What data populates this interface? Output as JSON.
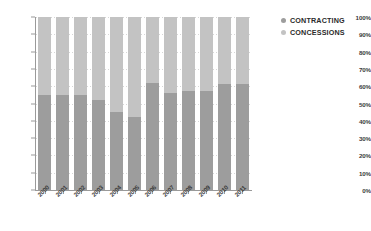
{
  "chart_data": {
    "type": "bar",
    "subtype": "100-percent-stacked-column",
    "title": "",
    "xlabel": "",
    "ylabel": "",
    "ylim": [
      0,
      100
    ],
    "ytick_labels": [
      "100%",
      "90%",
      "80%",
      "70%",
      "60%",
      "50%",
      "40%",
      "30%",
      "20%",
      "10%",
      "0%"
    ],
    "ytick_values": [
      100,
      90,
      80,
      70,
      60,
      50,
      40,
      30,
      20,
      10,
      0
    ],
    "grid": true,
    "grid_axis": "y",
    "legend_position": "right",
    "categories": [
      "2000",
      "2001",
      "2002",
      "2003",
      "2004",
      "2005",
      "2006",
      "2007",
      "2008",
      "2009",
      "2010",
      "2011"
    ],
    "series": [
      {
        "name": "CONTRACTING",
        "color": "#9d9d9d",
        "stack_position": "bottom",
        "values": [
          55,
          55,
          55,
          52,
          45,
          42,
          62,
          56,
          57,
          57,
          61,
          61
        ]
      },
      {
        "name": "CONCESSIONS",
        "color": "#c3c3c3",
        "stack_position": "top",
        "values": [
          45,
          45,
          45,
          48,
          55,
          58,
          38,
          44,
          43,
          43,
          39,
          39
        ]
      }
    ]
  },
  "legend": {
    "items": [
      {
        "label": "CONTRACTING",
        "marker": "legend-dot-icon",
        "color": "#9d9d9d"
      },
      {
        "label": "CONCESSIONS",
        "marker": "legend-dot-icon",
        "color": "#c3c3c3"
      }
    ]
  },
  "colors": {
    "contracting": "#9d9d9d",
    "concessions": "#c3c3c3",
    "axis": "#9a9a9a",
    "gridline": "#d7d7d7",
    "text": "#3a3a3a",
    "legend_text": "#2b2b2b",
    "background": "#ffffff"
  }
}
